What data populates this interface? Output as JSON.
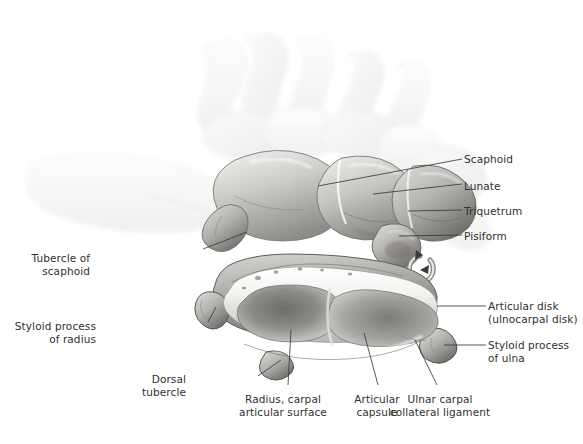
{
  "figure": {
    "background_color": "#ffffff",
    "label_color": "#2f2f2f",
    "rotation_icon": "rotation-arrow-icon"
  },
  "labels": [
    {
      "id": "scaphoid",
      "text": "Scaphoid",
      "align": "left",
      "x": 464,
      "y": 153
    },
    {
      "id": "lunate",
      "text": "Lunate",
      "align": "left",
      "x": 464,
      "y": 180
    },
    {
      "id": "triquetrum",
      "text": "Triquetrum",
      "align": "left",
      "x": 464,
      "y": 205
    },
    {
      "id": "pisiform",
      "text": "Pisiform",
      "align": "left",
      "x": 464,
      "y": 230
    },
    {
      "id": "tubercle-of-scaphoid",
      "text": "Tubercle of\nscaphoid",
      "align": "right",
      "x": 90,
      "y": 252,
      "w": 110
    },
    {
      "id": "styloid-process-of-radius",
      "text": "Styloid process\nof radius",
      "align": "right",
      "x": 96,
      "y": 320,
      "w": 108
    },
    {
      "id": "dorsal-tubercle",
      "text": "Dorsal\ntubercle",
      "align": "right",
      "x": 186,
      "y": 373,
      "w": 70
    },
    {
      "id": "radius-carpal-articular-surface",
      "text": "Radius, carpal\narticular surface",
      "align": "center",
      "x": 283,
      "y": 393,
      "w": 120
    },
    {
      "id": "articular-capsule",
      "text": "Articular\ncapsule",
      "align": "center",
      "x": 377,
      "y": 393,
      "w": 62
    },
    {
      "id": "ulnar-carpal-collateral-ligament",
      "text": "Ulnar carpal\ncollateral ligament",
      "align": "center",
      "x": 440,
      "y": 393,
      "w": 110
    },
    {
      "id": "articular-disk",
      "text": "Articular disk\n(ulnocarpal disk)",
      "align": "left",
      "x": 488,
      "y": 300
    },
    {
      "id": "styloid-process-of-ulna",
      "text": "Styloid process\nof ulna",
      "align": "left",
      "x": 488,
      "y": 339
    }
  ],
  "leaders": [
    {
      "id": "leader-scaphoid",
      "points": "318,186 462,159"
    },
    {
      "id": "leader-lunate",
      "points": "373,194 462,184"
    },
    {
      "id": "leader-triquetrum",
      "points": "408,211 462,210"
    },
    {
      "id": "leader-pisiform",
      "points": "399,236 462,235"
    },
    {
      "id": "leader-tubercle-of-scaphoid",
      "points": "203,249 247,232"
    },
    {
      "id": "leader-styloid-process-of-radius",
      "points": "208,322 216,307"
    },
    {
      "id": "leader-dorsal-tubercle",
      "points": "258,376 281,360"
    },
    {
      "id": "leader-radius-carpal-articular-surface",
      "points": "288,385 291,330"
    },
    {
      "id": "leader-articular-capsule",
      "points": "378,385 364,333"
    },
    {
      "id": "leader-ulnar-carpal-collateral-ligament",
      "points": "437,385 415,340"
    },
    {
      "id": "leader-articular-disk",
      "points": "437,306 486,306"
    },
    {
      "id": "leader-styloid-process-of-ulna",
      "points": "444,345 486,345"
    }
  ]
}
